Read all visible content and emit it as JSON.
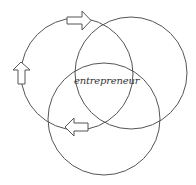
{
  "diagram": {
    "center_label": "entrepreneur",
    "stroke_color": "#555555",
    "background": "#ffffff",
    "circles": [
      {
        "name": "left-circle",
        "cx": 77,
        "cy": 74,
        "r": 56
      },
      {
        "name": "right-circle",
        "cx": 131,
        "cy": 73,
        "r": 56
      },
      {
        "name": "bottom-circle",
        "cx": 104,
        "cy": 119,
        "r": 56
      }
    ],
    "arrows": [
      {
        "name": "arrow-right-icon",
        "direction": "right",
        "position": "top of left circle"
      },
      {
        "name": "arrow-up-icon",
        "direction": "up",
        "position": "left side of left circle"
      },
      {
        "name": "arrow-left-icon",
        "direction": "left",
        "position": "bottom of left circle"
      }
    ]
  }
}
